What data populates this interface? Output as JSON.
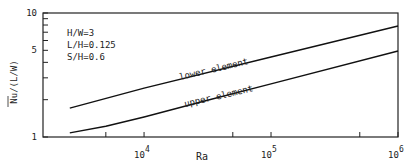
{
  "chart_data": {
    "type": "line",
    "title": "",
    "xlabel": "Ra",
    "ylabel": "Nu/(L/W)",
    "xscale": "log",
    "yscale": "log",
    "xlim": [
      1600,
      1000000
    ],
    "ylim": [
      1,
      10
    ],
    "grid": false,
    "x_ticks": [
      {
        "value": 10000,
        "label": "10",
        "exp": "4"
      },
      {
        "value": 100000,
        "label": "10",
        "exp": "5"
      },
      {
        "value": 1000000,
        "label": "10",
        "exp": "6"
      }
    ],
    "x_minor_ticks": [
      5000,
      50000,
      500000
    ],
    "y_ticks": [
      {
        "value": 1,
        "label": "1"
      },
      {
        "value": 5,
        "label": "5"
      },
      {
        "value": 10,
        "label": "10"
      }
    ],
    "y_minor_ticks": [
      2,
      3,
      4,
      6,
      7,
      8,
      9
    ],
    "annotations": [
      "H/W=3",
      "L/H=0.125",
      "S/H=0.6"
    ],
    "series": [
      {
        "name": "lower element",
        "x": [
          2600,
          10000,
          100000,
          1000000
        ],
        "y": [
          1.71,
          2.48,
          4.42,
          7.85
        ]
      },
      {
        "name": "upper element",
        "x": [
          2600,
          5000,
          10000,
          30000,
          100000,
          1000000
        ],
        "y": [
          1.08,
          1.22,
          1.45,
          1.95,
          2.68,
          4.94
        ]
      }
    ]
  }
}
